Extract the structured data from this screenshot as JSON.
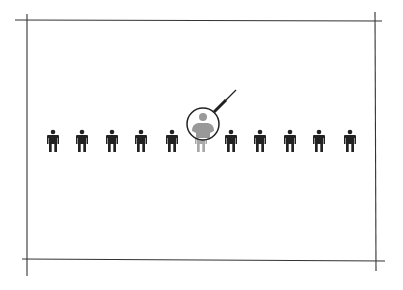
{
  "illustration": {
    "description": "Sketched frame containing a row of person icons; one person is highlighted under a magnifying glass",
    "person_count": 11,
    "highlighted_index": 5,
    "colors": {
      "frame": "#333333",
      "person": "#222222",
      "highlighted_person": "#9a9a9a",
      "magnifier": "#222222"
    },
    "icons": [
      "person-icon",
      "magnifying-glass-icon"
    ]
  }
}
